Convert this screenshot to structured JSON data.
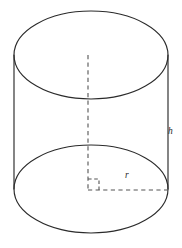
{
  "figure": {
    "shape": "cylinder",
    "stroke_color": "#2b2b2b",
    "dash_color": "#545454",
    "background_color": "#ffffff",
    "labels": {
      "height": "h",
      "radius": "r"
    },
    "geometry": {
      "center_x": 91,
      "radius_x": 77,
      "radius_y": 44,
      "top_ellipse_center_y": 55,
      "bottom_ellipse_center_y": 189,
      "left_side_x": 14,
      "right_side_x": 168,
      "axis_x": 88,
      "radius_line_y": 190,
      "right_angle_size": 11
    },
    "label_positions": {
      "height_x": 168,
      "height_y": 134,
      "radius_x": 125,
      "radius_y": 178
    }
  }
}
